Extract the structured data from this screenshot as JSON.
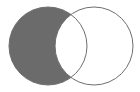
{
  "diagram": {
    "type": "venn",
    "operation": "difference",
    "shaded_region": "A only (A minus B)",
    "sets": [
      {
        "id": "A",
        "cx": 48,
        "cy": 46,
        "r": 39
      },
      {
        "id": "B",
        "cx": 94,
        "cy": 46,
        "r": 39
      }
    ],
    "colors": {
      "fill": "#6b6b6b",
      "stroke": "#6e6e6e",
      "background": "#ffffff"
    }
  }
}
